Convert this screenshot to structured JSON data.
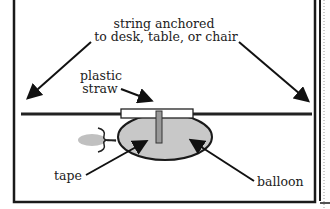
{
  "diagram": {
    "title_label": {
      "line1": "string anchored",
      "line2": "to desk, table, or chair"
    },
    "labels": {
      "straw_line1": "plastic",
      "straw_line2": "straw",
      "tape": "tape",
      "balloon": "balloon"
    },
    "colors": {
      "frame": "#1a1a1a",
      "string": "#222222",
      "balloon_fill": "#c8c8c8",
      "balloon_shadow": "#c0c0c0",
      "straw_fill": "#ffffff",
      "tape_fill": "#999999",
      "text": "#222222"
    }
  }
}
